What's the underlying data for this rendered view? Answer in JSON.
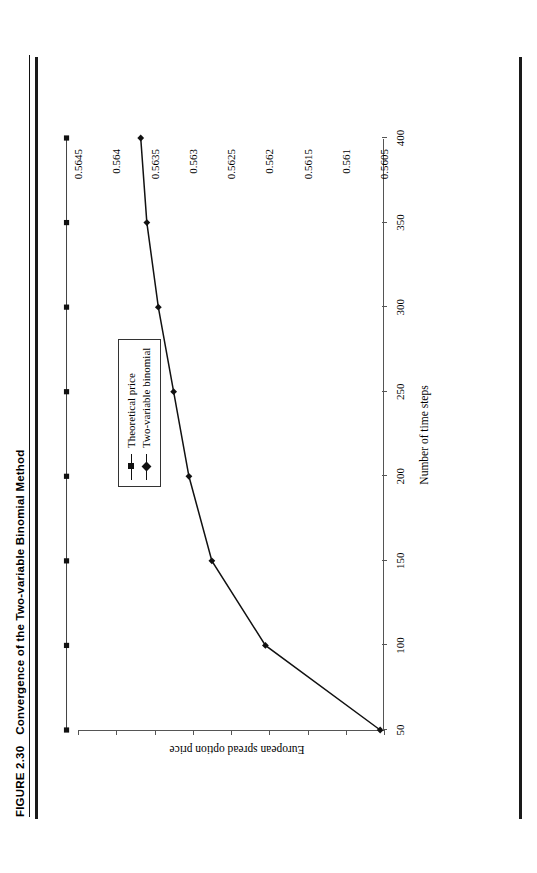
{
  "caption": {
    "figure_number": "FIGURE 2.30",
    "title": "Convergence of the Two-variable Binomial Method"
  },
  "chart_data": {
    "type": "line",
    "title": "Convergence of the Two-variable Binomial Method",
    "xlabel": "Number of time steps",
    "ylabel": "European spread option price",
    "xlim": [
      50,
      400
    ],
    "ylim": [
      0.5605,
      0.5645
    ],
    "xticks": [
      50,
      100,
      150,
      200,
      250,
      300,
      350,
      400
    ],
    "xtick_labels": [
      "50",
      "100",
      "150",
      "200",
      "250",
      "300",
      "350",
      "400"
    ],
    "yticks": [
      0.5605,
      0.561,
      0.5615,
      0.562,
      0.5625,
      0.563,
      0.5635,
      0.564,
      0.5645
    ],
    "ytick_labels": [
      "0.5605",
      "0.561",
      "0.5615",
      "0.562",
      "0.5625",
      "0.563",
      "0.5635",
      "0.564",
      "0.5645"
    ],
    "grid": false,
    "legend_position": "center",
    "x": [
      50,
      100,
      150,
      200,
      250,
      300,
      350,
      400
    ],
    "series": [
      {
        "name": "Theoretical price",
        "marker": "square",
        "values": [
          0.56465,
          0.56465,
          0.56465,
          0.56465,
          0.56465,
          0.56465,
          0.56465,
          0.56465
        ]
      },
      {
        "name": "Two-variable binomial",
        "marker": "diamond",
        "values": [
          0.56055,
          0.56205,
          0.56275,
          0.56305,
          0.56325,
          0.56345,
          0.5636,
          0.56368
        ]
      }
    ],
    "colors": {
      "line": "#111111",
      "axis": "#555555",
      "frame": "#999999"
    }
  },
  "legend": {
    "items": [
      {
        "label": "Theoretical price",
        "marker": "square"
      },
      {
        "label": "Two-variable binomial",
        "marker": "diamond"
      }
    ]
  }
}
